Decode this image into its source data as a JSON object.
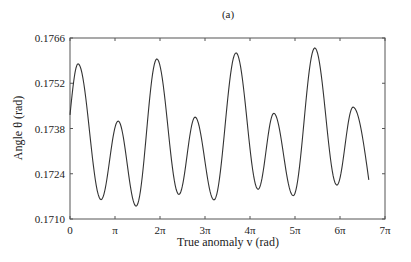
{
  "chart_data": {
    "type": "line",
    "title": "(a)",
    "xlabel": "True anomaly v (rad)",
    "ylabel": "Angle θ (rad)",
    "x_unit": "pi",
    "xlim": [
      0,
      7
    ],
    "ylim": [
      0.171,
      0.1766
    ],
    "xticks": [
      0,
      1,
      2,
      3,
      4,
      5,
      6,
      7
    ],
    "xtick_labels": [
      "0",
      "π",
      "2π",
      "3π",
      "4π",
      "5π",
      "6π",
      "7π"
    ],
    "yticks": [
      0.171,
      0.1724,
      0.1738,
      0.1752,
      0.1766
    ],
    "ytick_labels": [
      "0.1710",
      "0.1724",
      "0.1738",
      "0.1752",
      "0.1766"
    ],
    "grid": false,
    "legend": "none",
    "line_color": "#333333",
    "series": [
      {
        "name": "theta",
        "x": [
          0,
          0.18,
          0.69,
          1.07,
          1.47,
          1.93,
          2.42,
          2.78,
          3.2,
          3.69,
          4.18,
          4.53,
          4.96,
          5.44,
          5.93,
          6.29,
          6.64
        ],
        "y": [
          0.17422,
          0.1758,
          0.1716,
          0.17403,
          0.1714,
          0.17595,
          0.17176,
          0.17415,
          0.17159,
          0.17614,
          0.17192,
          0.17427,
          0.17172,
          0.17629,
          0.17205,
          0.17446,
          0.17221
        ]
      }
    ]
  }
}
